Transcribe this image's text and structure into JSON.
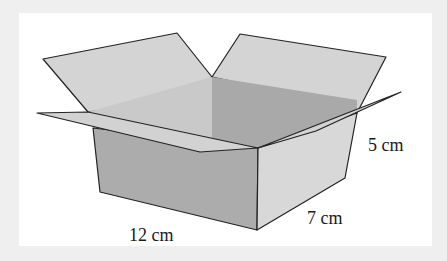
{
  "figure": {
    "colors": {
      "background": "#efefef",
      "panel": "#ffffff",
      "front_face": "#acacac",
      "right_face": "#d8d8d8",
      "interior_back": "#c9c9c9",
      "interior_right": "#a9a9a9",
      "flap": "#d4d4d4",
      "outline": "#222222"
    },
    "dimensions": {
      "length": "12 cm",
      "width": "7 cm",
      "height": "5 cm"
    }
  }
}
